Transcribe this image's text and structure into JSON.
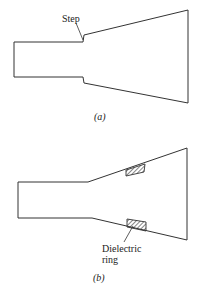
{
  "figure_a": {
    "annotation": "Step",
    "caption": "(a)"
  },
  "figure_b": {
    "annotation_line1": "Dielectric",
    "annotation_line2": "ring",
    "caption": "(b)"
  },
  "colors": {
    "stroke": "#333333",
    "background": "#ffffff"
  }
}
